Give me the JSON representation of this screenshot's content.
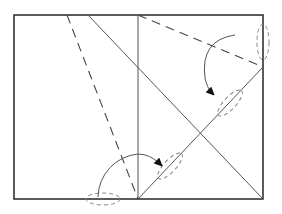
{
  "diagram": {
    "type": "origami-fold-diagram",
    "width": 282,
    "height": 214,
    "colors": {
      "background": "#ffffff",
      "outline": "#333333",
      "line": "#555555",
      "dashed": "#444444",
      "ellipse": "#888888",
      "arrow": "#111111"
    },
    "paper": {
      "x": 14,
      "y": 15,
      "width": 249,
      "height": 184
    },
    "crease_lines": [
      {
        "id": "vertical-center",
        "x1": 138,
        "y1": 15,
        "x2": 138,
        "y2": 199
      },
      {
        "id": "diagonal-down",
        "x1": 88,
        "y1": 15,
        "x2": 263,
        "y2": 199
      },
      {
        "id": "diagonal-up",
        "x1": 138,
        "y1": 199,
        "x2": 263,
        "y2": 67
      }
    ],
    "valley_folds": [
      {
        "id": "dashed-left",
        "x1": 67,
        "y1": 15,
        "x2": 138,
        "y2": 199
      },
      {
        "id": "dashed-right",
        "x1": 138,
        "y1": 15,
        "x2": 263,
        "y2": 67
      }
    ],
    "fold_arrows": [
      {
        "id": "arrow-left-fold",
        "path": "M 98 197 A 44 44 0 0 1 138 154 Q 150 154 160 164",
        "tip": [
          162,
          166
        ]
      },
      {
        "id": "arrow-right-fold",
        "path": "M 235 35 Q 200 40 205 78 Q 207 88 212 93",
        "tip": [
          213,
          96
        ]
      }
    ],
    "alignment_marks": [
      {
        "id": "ellipse-bottom",
        "cx": 103,
        "cy": 199,
        "rx": 17,
        "ry": 6,
        "rotate": 0
      },
      {
        "id": "ellipse-right-edge",
        "cx": 263,
        "cy": 42,
        "rx": 6,
        "ry": 18,
        "rotate": 0
      },
      {
        "id": "ellipse-diag-upper",
        "cx": 230,
        "cy": 103,
        "rx": 17,
        "ry": 6,
        "rotate": -47
      },
      {
        "id": "ellipse-diag-lower",
        "cx": 170,
        "cy": 166,
        "rx": 17,
        "ry": 6,
        "rotate": -47
      }
    ]
  }
}
